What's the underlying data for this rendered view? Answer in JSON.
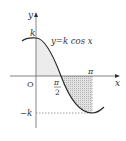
{
  "diagram": {
    "equation": "y=k cos x",
    "axis_labels": {
      "x": "x",
      "y": "y"
    },
    "origin_label": "O",
    "tick_labels": {
      "k": "k",
      "neg_k": "−k",
      "pi": "π",
      "half_pi_num": "π",
      "half_pi_den": "2"
    },
    "colors": {
      "curve": "#2a2a2a",
      "axes": "#555555",
      "shade_positive": "#e6e6e6",
      "shade_negative": "#d0d0d0",
      "dashed": "#777777"
    }
  }
}
